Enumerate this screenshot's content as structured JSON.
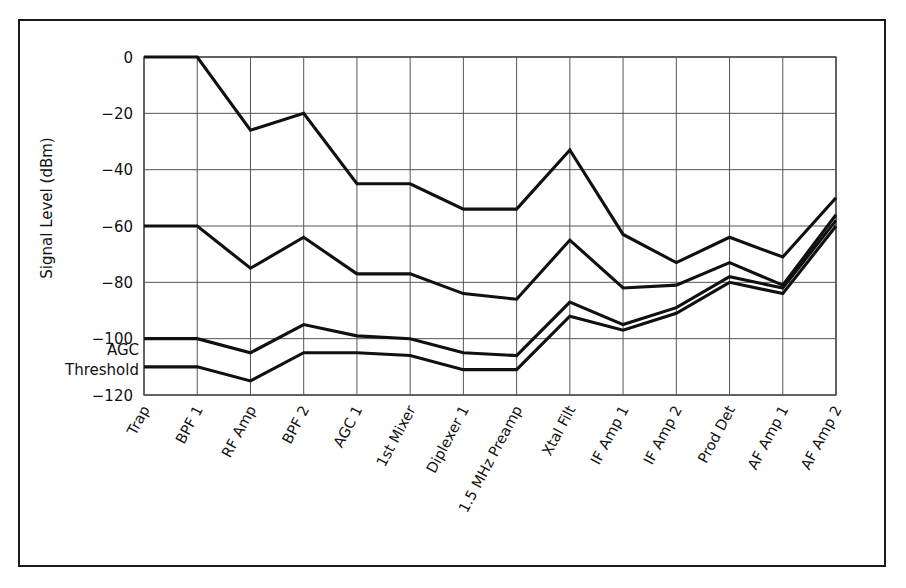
{
  "chart_data": {
    "type": "line",
    "title": "",
    "xlabel": "",
    "ylabel": "Signal Level (dBm)",
    "ylim": [
      -120,
      0
    ],
    "yticks": [
      0,
      -20,
      -40,
      -60,
      -80,
      -100,
      -120
    ],
    "ytick_labels": [
      "0",
      "−20",
      "−40",
      "−60",
      "−80",
      "−100",
      "−120"
    ],
    "grid": true,
    "legend": "none",
    "annotations": [
      {
        "text": "AGC",
        "value": -104,
        "note": "AGC Threshold label line 1"
      },
      {
        "text": "Threshold",
        "value": -111,
        "note": "AGC Threshold label line 2"
      }
    ],
    "categories": [
      "Trap",
      "BPF 1",
      "RF Amp",
      "BPF 2",
      "AGC 1",
      "1st Mixer",
      "Diplexer 1",
      "1.5 MHz Preamp",
      "Xtal Filt",
      "IF Amp 1",
      "IF Amp 2",
      "Prod Det",
      "AF Amp 1",
      "AF Amp 2"
    ],
    "series": [
      {
        "name": "Signal 1",
        "values": [
          0,
          0,
          -26,
          -20,
          -45,
          -45,
          -54,
          -54,
          -33,
          -63,
          -73,
          -64,
          -71,
          -50
        ]
      },
      {
        "name": "Signal 2",
        "values": [
          -60,
          -60,
          -75,
          -64,
          -77,
          -77,
          -84,
          -86,
          -65,
          -82,
          -81,
          -73,
          -81,
          -56
        ]
      },
      {
        "name": "Signal 3",
        "values": [
          -100,
          -100,
          -105,
          -95,
          -99,
          -100,
          -105,
          -106,
          -87,
          -95,
          -89,
          -78,
          -82,
          -58
        ]
      },
      {
        "name": "Signal 4",
        "values": [
          -110,
          -110,
          -115,
          -105,
          -105,
          -106,
          -111,
          -111,
          -92,
          -97,
          -91,
          -80,
          -84,
          -60
        ]
      }
    ]
  },
  "figure": {
    "frame_color": "#1a1a1a",
    "line_color": "#101010",
    "grid_color": "#555555",
    "background": "#ffffff"
  }
}
